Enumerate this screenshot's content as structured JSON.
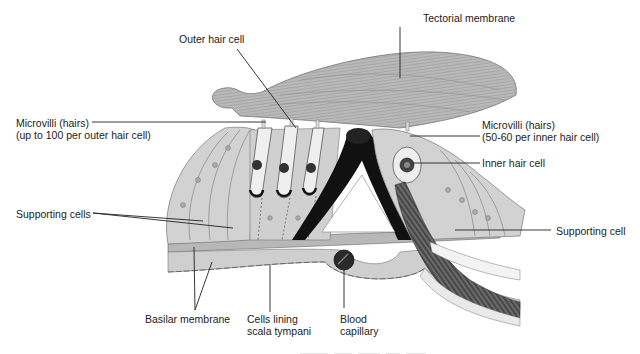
{
  "figure": {
    "labels": {
      "tectorial_membrane": "Tectorial membrane",
      "outer_hair_cell": "Outer hair cell",
      "microvilli_outer": {
        "line1": "Microvilli (hairs)",
        "line2": "(up to 100 per outer hair cell)"
      },
      "microvilli_inner": {
        "line1": "Microvilli (hairs)",
        "line2": "(50-60 per inner hair cell)"
      },
      "inner_hair_cell": "Inner hair cell",
      "supporting_cells": "Supporting cells",
      "supporting_cell": "Supporting cell",
      "basilar_membrane": "Basilar membrane",
      "cells_lining": {
        "line1": "Cells lining",
        "line2": "scala tympani"
      },
      "blood_capillary": {
        "line1": "Blood",
        "line2": "capillary"
      }
    },
    "colors": {
      "tissue_gray": "#c9c9c9",
      "membrane_gray": "#b5b5b5",
      "dark_pillar": "#111111",
      "line": "#222222",
      "text": "#222222"
    }
  }
}
